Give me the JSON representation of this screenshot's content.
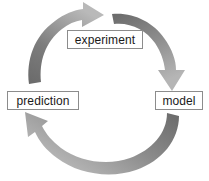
{
  "diagram": {
    "background_color": "#ffffff",
    "node_border_color": "#8c8c8c",
    "node_fill_color": "#ffffff",
    "node_text_color": "#1a1a1a",
    "arrow_color_dark": "#6e6e6e",
    "arrow_color_light": "#b7b7b7",
    "nodes": [
      {
        "id": "experiment",
        "label": "experiment"
      },
      {
        "id": "model",
        "label": "model"
      },
      {
        "id": "prediction",
        "label": "prediction"
      }
    ],
    "arrows": [
      {
        "id": "experiment-to-model",
        "from": "experiment",
        "to": "model",
        "direction": "clockwise",
        "head": "down"
      },
      {
        "id": "model-to-prediction",
        "from": "model",
        "to": "prediction",
        "direction": "clockwise",
        "head": "up-left"
      },
      {
        "id": "prediction-to-experiment",
        "from": "prediction",
        "to": "experiment",
        "direction": "clockwise",
        "head": "right"
      }
    ]
  }
}
